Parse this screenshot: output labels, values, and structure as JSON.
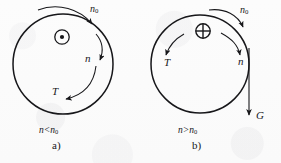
{
  "figure": {
    "type": "physics-diagram",
    "background_color": "#fdfdfd",
    "ink_color": "#17171a",
    "panels": [
      {
        "id": "a",
        "panel_letter": "a)",
        "caption": "n<n₀",
        "caption_parts": {
          "left": "n",
          "relation": "<",
          "right": "n",
          "right_sub": "0"
        },
        "circle": {
          "cx": 63,
          "cy": 64,
          "r": 50
        },
        "center_symbol": "dot-in-circle",
        "center_symbol_meaning": "vector out of page",
        "labels": [
          {
            "name": "n0",
            "text": "n",
            "subscript": "0",
            "x": 89,
            "y": 9
          },
          {
            "name": "n",
            "text": "n",
            "subscript": "",
            "x": 86,
            "y": 57
          },
          {
            "name": "T",
            "text": "T",
            "subscript": "",
            "x": 54,
            "y": 92
          }
        ]
      },
      {
        "id": "b",
        "panel_letter": "b)",
        "caption": "n>n₀",
        "caption_parts": {
          "left": "n",
          "relation": ">",
          "right": "n",
          "right_sub": "0"
        },
        "circle": {
          "cx": 200,
          "cy": 64,
          "r": 49
        },
        "center_symbol": "cross-in-circle",
        "center_symbol_meaning": "vector into page",
        "labels": [
          {
            "name": "n0",
            "text": "n",
            "subscript": "0",
            "x": 231,
            "y": 9
          },
          {
            "name": "n",
            "text": "n",
            "subscript": "",
            "x": 238,
            "y": 58
          },
          {
            "name": "T",
            "text": "T",
            "subscript": "",
            "x": 167,
            "y": 58
          },
          {
            "name": "G",
            "text": "G",
            "subscript": "",
            "x": 258,
            "y": 113
          }
        ]
      }
    ]
  }
}
